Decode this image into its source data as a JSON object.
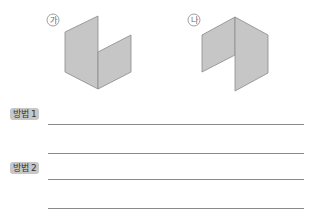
{
  "figures": [
    {
      "label": "가",
      "label_symbol": "㉮"
    },
    {
      "label": "나",
      "label_symbol": "㉯"
    }
  ],
  "colors": {
    "panel_fill": "#c6c6c6",
    "panel_stroke": "#8a8a8a",
    "badge_bg": "#c7c7c7",
    "line": "#8a8a8a"
  },
  "methods": [
    {
      "label": "방법 1"
    },
    {
      "label": "방법 2"
    }
  ]
}
